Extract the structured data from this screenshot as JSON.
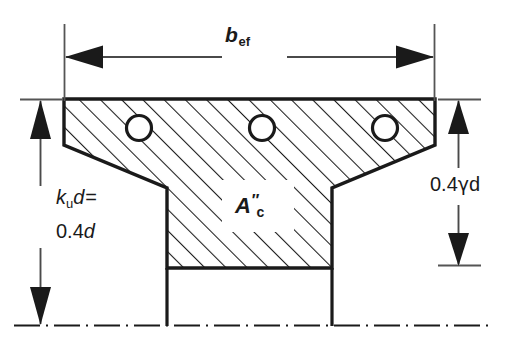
{
  "figure": {
    "type": "engineering-cross-section-diagram",
    "canvas": {
      "width": 505,
      "height": 343
    },
    "background_color": "#ffffff",
    "line_color": "#1a1a1a"
  },
  "labels": {
    "effective_width": {
      "base": "b",
      "subscript": "ef",
      "full_text": "b_ef",
      "meaning": "effective flange width"
    },
    "neutral_axis_depth": {
      "line1_base": "k",
      "line1_subscript": "u",
      "line1_var": "d",
      "line1_equals": "=",
      "line1_full": "k_u d =",
      "line2_value": "0.4",
      "line2_var": "d",
      "line2_full": "0.4d",
      "meaning": "depth to neutral axis"
    },
    "stress_block_depth": {
      "coefficient": "0.4",
      "greek": "γ",
      "variable": "d",
      "full_text": "0.4γd",
      "meaning": "depth of rectangular compressive stress block"
    },
    "concrete_area": {
      "base": "A",
      "superscript": "″",
      "subscript": "c",
      "full_text": "A″c",
      "meaning": "effective area of concrete in compression"
    }
  },
  "geometry": {
    "flange": {
      "top_y": 99,
      "left_x": 64,
      "right_x": 435,
      "outer_edge_bottom_y": 145
    },
    "haunch": {
      "left_slope_from": [
        64,
        145
      ],
      "left_slope_to": [
        167,
        188
      ],
      "right_slope_from": [
        435,
        145
      ],
      "right_slope_to": [
        332,
        188
      ]
    },
    "web": {
      "left_x": 167,
      "right_x": 332,
      "top_y": 188,
      "hatch_bottom_y": 268,
      "bottom_y": 325
    },
    "centerline_y": 325,
    "reinforcement_bars": [
      {
        "cx": 139,
        "cy": 128,
        "r": 13
      },
      {
        "cx": 262,
        "cy": 128,
        "r": 13
      },
      {
        "cx": 385,
        "cy": 128,
        "r": 13
      }
    ],
    "hatching": {
      "angle_deg": 45,
      "spacing_px": 15,
      "direction": "lower-left-to-upper-right"
    }
  },
  "dimensions": {
    "horizontal_span": {
      "y": 57,
      "from_x": 64,
      "to_x": 435,
      "extension_top_y": 24,
      "extension_bottom_y": 101,
      "arrowheads": "both"
    },
    "left_vertical": {
      "x": 40,
      "from_y": 99,
      "to_y": 325,
      "arrowheads": "both",
      "tick_top": {
        "x1": 20,
        "x2": 62,
        "y": 99
      }
    },
    "right_vertical": {
      "x": 458,
      "from_y": 99,
      "to_y": 265,
      "arrowheads": "both",
      "tick_top": {
        "x1": 438,
        "x2": 481,
        "y": 99
      },
      "tick_bottom": {
        "x1": 438,
        "x2": 481,
        "y": 265
      }
    }
  }
}
